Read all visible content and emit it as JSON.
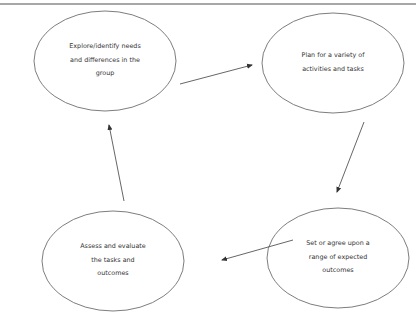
{
  "diagram": {
    "type": "cycle",
    "border_color": "#8a8a8a",
    "stroke_color": "#6e6e6e",
    "text_color": "#333333",
    "nodes": [
      {
        "id": "explore",
        "lines": [
          "Explore/identify needs",
          "and differences in the",
          "group"
        ]
      },
      {
        "id": "plan",
        "lines": [
          "Plan for a variety of",
          "activities and tasks"
        ]
      },
      {
        "id": "set-outcomes",
        "lines": [
          "Set or agree upon a",
          "range of expected",
          "outcomes"
        ]
      },
      {
        "id": "assess",
        "lines": [
          "Assess and evaluate",
          "the tasks and",
          "outcomes"
        ]
      }
    ],
    "edges": [
      {
        "from": "explore",
        "to": "plan"
      },
      {
        "from": "plan",
        "to": "set-outcomes"
      },
      {
        "from": "set-outcomes",
        "to": "assess"
      },
      {
        "from": "assess",
        "to": "explore"
      }
    ]
  }
}
